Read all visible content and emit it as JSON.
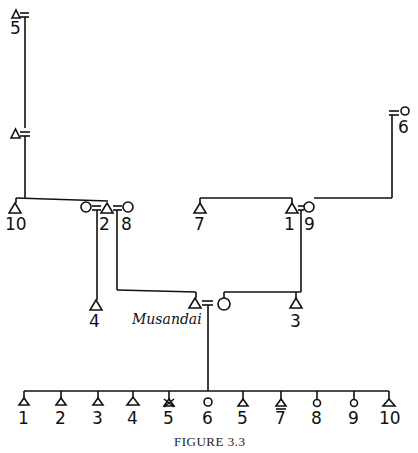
{
  "figure": {
    "caption": "FIGURE 3.3",
    "ego_label": "Musandai"
  },
  "top_ancestor": {
    "number": "5",
    "sex": "male"
  },
  "second_ancestor": {
    "sex": "male"
  },
  "right_ancestor": {
    "number": "6",
    "sex": "female"
  },
  "parent_generation": {
    "left_group": [
      {
        "number": "10",
        "sex": "male"
      },
      {
        "number": "",
        "sex": "female",
        "note": "wife of 2"
      },
      {
        "number": "2",
        "sex": "male"
      },
      {
        "number": "8",
        "sex": "female"
      }
    ],
    "right_group": [
      {
        "number": "7",
        "sex": "male"
      },
      {
        "number": "1",
        "sex": "male"
      },
      {
        "number": "9",
        "sex": "female"
      }
    ]
  },
  "ego_generation": {
    "left_child": {
      "number": "4",
      "sex": "male"
    },
    "ego": {
      "sex": "male"
    },
    "ego_wife": {
      "sex": "female"
    },
    "right_child": {
      "number": "3",
      "sex": "male"
    }
  },
  "children": [
    {
      "number": "1",
      "sex": "male"
    },
    {
      "number": "2",
      "sex": "male"
    },
    {
      "number": "3",
      "sex": "male"
    },
    {
      "number": "4",
      "sex": "male"
    },
    {
      "number": "5",
      "sex": "male",
      "deceased": true
    },
    {
      "number": "6",
      "sex": "female"
    },
    {
      "number": "5",
      "sex": "male"
    },
    {
      "number": "7",
      "sex": "male"
    },
    {
      "number": "8",
      "sex": "female"
    },
    {
      "number": "9",
      "sex": "female"
    },
    {
      "number": "10",
      "sex": "male"
    }
  ]
}
